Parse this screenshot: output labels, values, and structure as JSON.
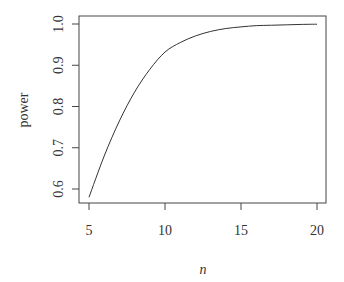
{
  "chart_data": {
    "type": "line",
    "title": "",
    "xlabel": "n",
    "ylabel": "power",
    "xlim": [
      5,
      20
    ],
    "ylim": [
      0.58,
      1.0
    ],
    "x_ticks": [
      5,
      10,
      15,
      20
    ],
    "x_tick_labels": [
      "5",
      "10",
      "15",
      "20"
    ],
    "y_ticks": [
      0.6,
      0.7,
      0.8,
      0.9,
      1.0
    ],
    "y_tick_labels": [
      "0.6",
      "0.7",
      "0.8",
      "0.9",
      "1.0"
    ],
    "grid": false,
    "legend": null,
    "series": [
      {
        "name": "power",
        "color": "#333333",
        "x": [
          5,
          6,
          7,
          8,
          9,
          10,
          11,
          12,
          13,
          14,
          15,
          16,
          17,
          18,
          19,
          20
        ],
        "values": [
          0.58,
          0.68,
          0.765,
          0.835,
          0.89,
          0.932,
          0.955,
          0.971,
          0.982,
          0.989,
          0.993,
          0.996,
          0.997,
          0.998,
          0.999,
          0.9995
        ]
      }
    ]
  }
}
